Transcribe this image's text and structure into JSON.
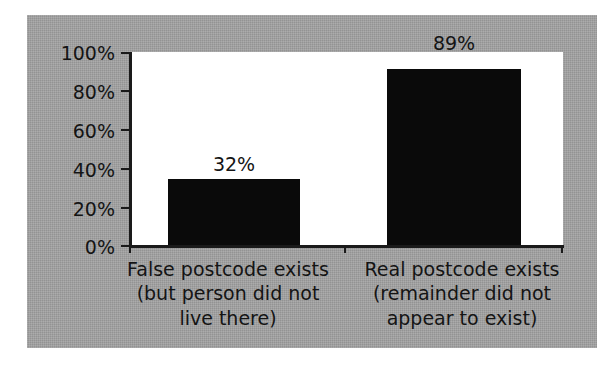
{
  "chart_data": {
    "type": "bar",
    "title": "",
    "subtitle": "",
    "xlabel": "",
    "ylabel": "",
    "categories": [
      "False postcode exists (but person did not live there)",
      "Real postcode exists (remainder did not appear to exist)"
    ],
    "category_lines": [
      [
        "False postcode exists",
        "(but person did not",
        "live there)"
      ],
      [
        "Real postcode exists",
        "(remainder did not",
        "appear to exist)"
      ]
    ],
    "values": [
      32,
      89
    ],
    "value_labels": [
      "32%",
      "89%"
    ],
    "bar_drawn_heights_pct": [
      34,
      91
    ],
    "ylim": [
      0,
      100
    ],
    "ytick_values": [
      0,
      20,
      40,
      60,
      80,
      100
    ],
    "ytick_labels": [
      "0%",
      "20%",
      "40%",
      "60%",
      "80%",
      "100%"
    ],
    "grid": false,
    "legend": false,
    "legend_position": "none",
    "colors": {
      "bar": "#0a0a0a",
      "plot_background": "#ffffff",
      "panel_background": "#a3a3a3",
      "axis": "#1a1a1a",
      "text": "#141414",
      "figure_background": "#ffffff"
    }
  }
}
